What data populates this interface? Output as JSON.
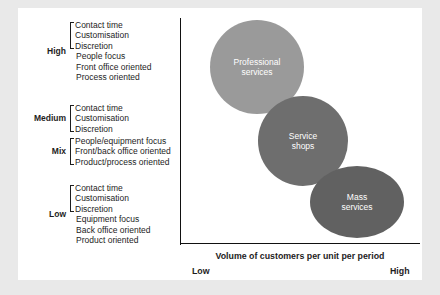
{
  "diagram": {
    "colors": {
      "professional_services": "#9a9a9a",
      "service_shops": "#6e6e6e",
      "mass_services": "#616161",
      "axis": "#111111",
      "text": "#1d1d1d",
      "canvas_background": "#ffffff",
      "page_background": "#e9e9e9"
    },
    "groups": [
      {
        "label": "High",
        "bracketed": [
          "Contact time",
          "Customisation",
          "Discretion"
        ],
        "plain": [
          "People focus",
          "Front office oriented",
          "Process oriented"
        ]
      },
      {
        "label": "Medium",
        "bracketed": [
          "Contact time",
          "Customisation",
          "Discretion"
        ],
        "plain": []
      },
      {
        "label": "Mix",
        "bracketed": [
          "People/equipment focus",
          "Front/back office oriented",
          "Product/process oriented"
        ],
        "plain": []
      },
      {
        "label": "Low",
        "bracketed": [
          "Contact time",
          "Customisation",
          "Discretion"
        ],
        "plain": [
          "Equipment focus",
          "Back office oriented",
          "Product oriented"
        ]
      }
    ],
    "bubbles": [
      {
        "id": "professional",
        "line1": "Professional",
        "line2": "services"
      },
      {
        "id": "service_shops",
        "line1": "Service",
        "line2": "shops"
      },
      {
        "id": "mass",
        "line1": "Mass",
        "line2": "services"
      }
    ],
    "x_axis": {
      "title": "Volume of customers per unit per period",
      "low": "Low",
      "high": "High"
    }
  }
}
